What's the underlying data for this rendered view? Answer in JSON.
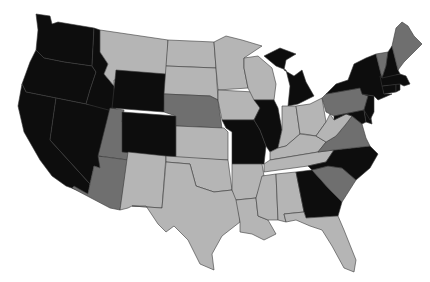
{
  "map": {
    "title": "",
    "type": "choropleth",
    "region": "United States (contiguous)",
    "colors": {
      "black": "#0d0d0d",
      "dark_gray": "#6f6f6f",
      "light_gray": "#b5b5b5",
      "border": "#3a3a3a",
      "background": "#ffffff"
    },
    "states": [
      {
        "code": "WA",
        "shade": "black"
      },
      {
        "code": "OR",
        "shade": "black"
      },
      {
        "code": "CA",
        "shade": "black"
      },
      {
        "code": "NV",
        "shade": "black"
      },
      {
        "code": "ID",
        "shade": "black"
      },
      {
        "code": "MT",
        "shade": "light_gray"
      },
      {
        "code": "WY",
        "shade": "black"
      },
      {
        "code": "UT",
        "shade": "dark_gray"
      },
      {
        "code": "AZ",
        "shade": "dark_gray"
      },
      {
        "code": "CO",
        "shade": "black"
      },
      {
        "code": "NM",
        "shade": "light_gray"
      },
      {
        "code": "ND",
        "shade": "light_gray"
      },
      {
        "code": "SD",
        "shade": "light_gray"
      },
      {
        "code": "NE",
        "shade": "dark_gray"
      },
      {
        "code": "KS",
        "shade": "light_gray"
      },
      {
        "code": "OK",
        "shade": "light_gray"
      },
      {
        "code": "TX",
        "shade": "light_gray"
      },
      {
        "code": "MN",
        "shade": "light_gray"
      },
      {
        "code": "IA",
        "shade": "light_gray"
      },
      {
        "code": "MO",
        "shade": "black"
      },
      {
        "code": "AR",
        "shade": "light_gray"
      },
      {
        "code": "LA",
        "shade": "light_gray"
      },
      {
        "code": "WI",
        "shade": "light_gray"
      },
      {
        "code": "IL",
        "shade": "black"
      },
      {
        "code": "MI",
        "shade": "black"
      },
      {
        "code": "IN",
        "shade": "light_gray"
      },
      {
        "code": "OH",
        "shade": "light_gray"
      },
      {
        "code": "KY",
        "shade": "light_gray"
      },
      {
        "code": "TN",
        "shade": "light_gray"
      },
      {
        "code": "MS",
        "shade": "light_gray"
      },
      {
        "code": "AL",
        "shade": "light_gray"
      },
      {
        "code": "GA",
        "shade": "black"
      },
      {
        "code": "FL",
        "shade": "light_gray"
      },
      {
        "code": "SC",
        "shade": "dark_gray"
      },
      {
        "code": "NC",
        "shade": "black"
      },
      {
        "code": "VA",
        "shade": "dark_gray"
      },
      {
        "code": "WV",
        "shade": "light_gray"
      },
      {
        "code": "PA",
        "shade": "dark_gray"
      },
      {
        "code": "MD",
        "shade": "black"
      },
      {
        "code": "DE",
        "shade": "black"
      },
      {
        "code": "NJ",
        "shade": "black"
      },
      {
        "code": "NY",
        "shade": "black"
      },
      {
        "code": "CT",
        "shade": "black"
      },
      {
        "code": "RI",
        "shade": "black"
      },
      {
        "code": "MA",
        "shade": "black"
      },
      {
        "code": "VT",
        "shade": "dark_gray"
      },
      {
        "code": "NH",
        "shade": "black"
      },
      {
        "code": "ME",
        "shade": "dark_gray"
      }
    ]
  }
}
